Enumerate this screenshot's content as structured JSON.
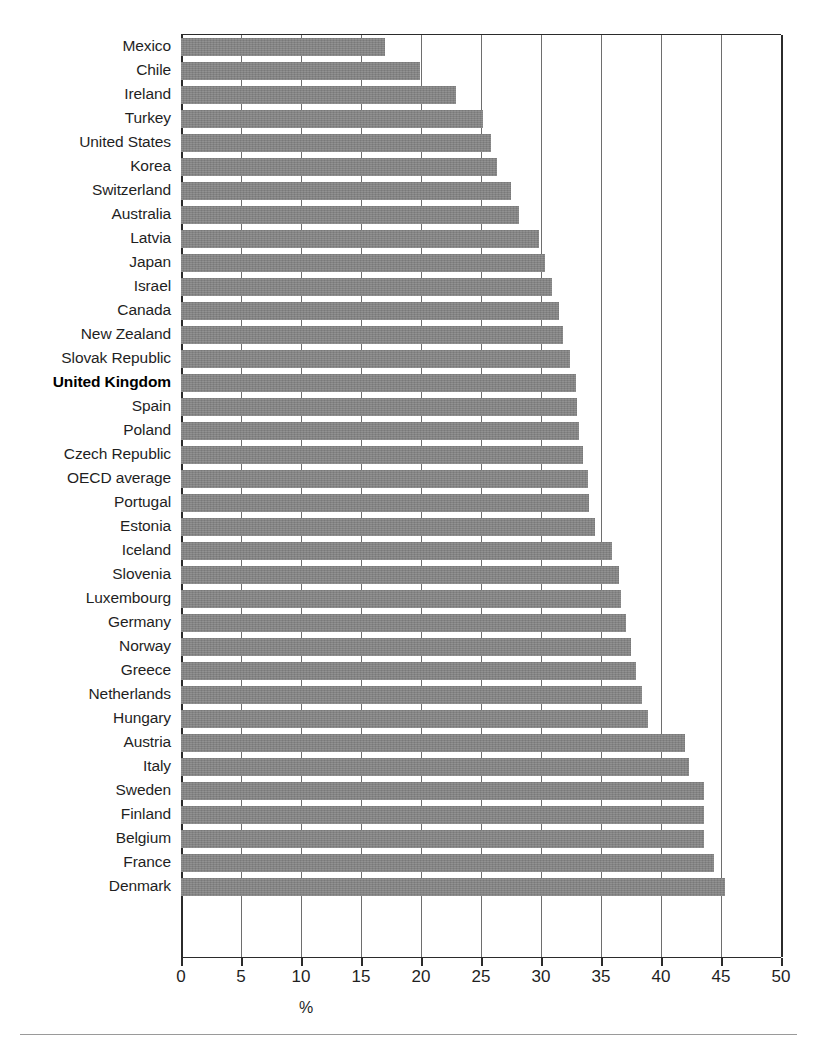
{
  "chart_data": {
    "type": "bar",
    "orientation": "horizontal",
    "title": "",
    "subtitle": "",
    "xlabel": "%",
    "ylabel": "",
    "xlim": [
      0,
      50
    ],
    "xticks": [
      0,
      5,
      10,
      15,
      20,
      25,
      30,
      35,
      40,
      45,
      50
    ],
    "xtick_labels": [
      "0",
      "5",
      "10",
      "15",
      "20",
      "25",
      "30",
      "35",
      "40",
      "45",
      "50"
    ],
    "grid": true,
    "legend": "none",
    "bar_color": "#848484",
    "highlight_category": "United Kingdom",
    "categories": [
      "Mexico",
      "Chile",
      "Ireland",
      "Turkey",
      "United States",
      "Korea",
      "Switzerland",
      "Australia",
      "Latvia",
      "Japan",
      "Israel",
      "Canada",
      "New Zealand",
      "Slovak Republic",
      "United Kingdom",
      "Spain",
      "Poland",
      "Czech Republic",
      "OECD average",
      "Portugal",
      "Estonia",
      "Iceland",
      "Slovenia",
      "Luxembourg",
      "Germany",
      "Norway",
      "Greece",
      "Netherlands",
      "Hungary",
      "Austria",
      "Italy",
      "Sweden",
      "Finland",
      "Belgium",
      "France",
      "Denmark"
    ],
    "values": [
      17.0,
      19.9,
      22.9,
      25.2,
      25.8,
      26.3,
      27.5,
      28.2,
      29.8,
      30.3,
      30.9,
      31.5,
      31.8,
      32.4,
      32.9,
      33.0,
      33.2,
      33.5,
      33.9,
      34.0,
      34.5,
      35.9,
      36.5,
      36.7,
      37.1,
      37.5,
      37.9,
      38.4,
      38.9,
      42.0,
      42.3,
      43.6,
      43.6,
      43.6,
      44.4,
      45.3
    ]
  }
}
